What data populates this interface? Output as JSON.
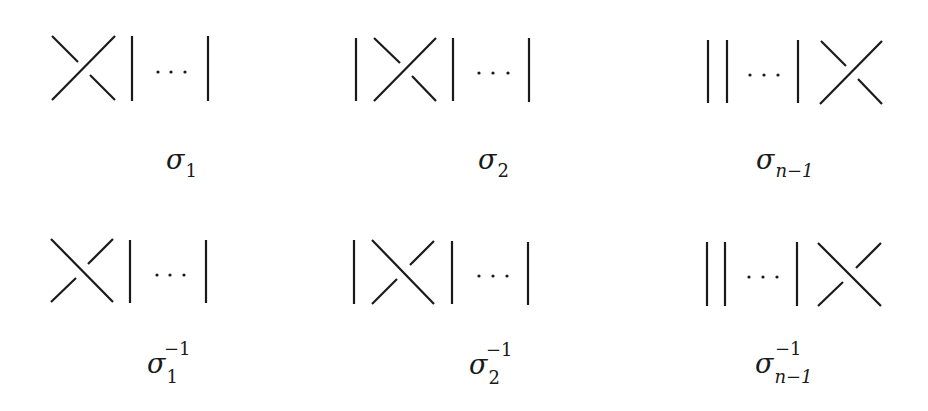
{
  "figure": {
    "generators": [
      {
        "id": "sigma_1",
        "symbol": "σ",
        "subscript": "1",
        "superscript": "",
        "crossing_position": "strands 1-2 (left)",
        "over_strand": "bottom-left to top-right"
      },
      {
        "id": "sigma_2",
        "symbol": "σ",
        "subscript": "2",
        "superscript": "",
        "crossing_position": "strands 2-3",
        "over_strand": "bottom-left to top-right"
      },
      {
        "id": "sigma_n-1",
        "symbol": "σ",
        "subscript": "n−1",
        "superscript": "",
        "crossing_position": "strands n-1 to n (right)",
        "over_strand": "bottom-left to top-right"
      }
    ],
    "inverses": [
      {
        "id": "sigma_1_inv",
        "symbol": "σ",
        "subscript": "1",
        "superscript": "−1",
        "crossing_position": "strands 1-2 (left)",
        "over_strand": "top-left to bottom-right"
      },
      {
        "id": "sigma_2_inv",
        "symbol": "σ",
        "subscript": "2",
        "superscript": "−1",
        "crossing_position": "strands 2-3",
        "over_strand": "top-left to bottom-right"
      },
      {
        "id": "sigma_n-1_inv",
        "symbol": "σ",
        "subscript": "n−1",
        "superscript": "−1",
        "crossing_position": "strands n-1 to n (right)",
        "over_strand": "top-left to bottom-right"
      }
    ],
    "ellipsis": "⋯",
    "stroke_color": "#1a1a1a",
    "background": "#ffffff"
  }
}
